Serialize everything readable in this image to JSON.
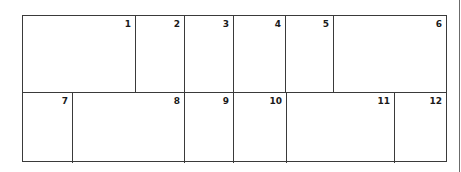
{
  "diagram": {
    "type": "numbered-grid-layout",
    "rows": [
      {
        "cells": [
          {
            "label": "1",
            "left": 0,
            "width": 113
          },
          {
            "label": "2",
            "left": 113,
            "width": 49
          },
          {
            "label": "3",
            "left": 162,
            "width": 49
          },
          {
            "label": "4",
            "left": 211,
            "width": 52
          },
          {
            "label": "5",
            "left": 263,
            "width": 48
          },
          {
            "label": "6",
            "left": 311,
            "width": 112
          }
        ]
      },
      {
        "cells": [
          {
            "label": "7",
            "left": 0,
            "width": 50
          },
          {
            "label": "8",
            "left": 50,
            "width": 112
          },
          {
            "label": "9",
            "left": 162,
            "width": 49
          },
          {
            "label": "10",
            "left": 211,
            "width": 53
          },
          {
            "label": "11",
            "left": 264,
            "width": 108
          },
          {
            "label": "12",
            "left": 372,
            "width": 51
          }
        ]
      }
    ]
  }
}
